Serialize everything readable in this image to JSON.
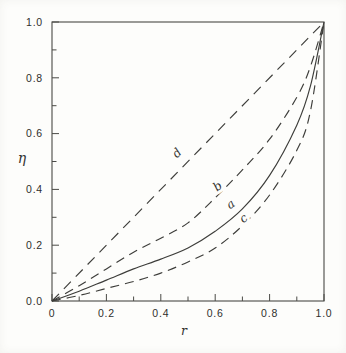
{
  "figure": {
    "background": "#fdfdfb",
    "ink_color": "#3d3d3a",
    "frame_color": "#4a4a46"
  },
  "chart_data": {
    "type": "line",
    "title": "",
    "xlabel": "r",
    "ylabel": "η",
    "xlim": [
      0,
      1.0
    ],
    "ylim": [
      0,
      1.0
    ],
    "grid": false,
    "legend_position": "none",
    "x_major_ticks": [
      0,
      0.2,
      0.4,
      0.6,
      0.8,
      1.0
    ],
    "x_tick_labels": [
      "0",
      "0.2",
      "0.4",
      "0.6",
      "0.8",
      "1.0"
    ],
    "x_minor_ticks": [
      0.1,
      0.3,
      0.5,
      0.7,
      0.9
    ],
    "y_major_ticks": [
      0,
      0.2,
      0.4,
      0.6,
      0.8,
      1.0
    ],
    "y_tick_labels": [
      "0.0",
      "0.2",
      "0.4",
      "0.6",
      "0.8",
      "1.0"
    ],
    "y_minor_ticks": [
      0.1,
      0.3,
      0.5,
      0.7,
      0.9
    ],
    "series": [
      {
        "name": "d",
        "line_style": "dashed",
        "dash": "10 7",
        "points": [
          [
            0,
            0
          ],
          [
            1,
            1
          ]
        ],
        "label": {
          "text": "d",
          "x": 0.47,
          "y": 0.52,
          "angle": -45
        }
      },
      {
        "name": "b",
        "line_style": "dashed",
        "dash": "9 6",
        "points": [
          [
            0,
            0
          ],
          [
            0.1,
            0.055
          ],
          [
            0.2,
            0.115
          ],
          [
            0.3,
            0.175
          ],
          [
            0.4,
            0.225
          ],
          [
            0.5,
            0.28
          ],
          [
            0.6,
            0.37
          ],
          [
            0.7,
            0.47
          ],
          [
            0.8,
            0.58
          ],
          [
            0.9,
            0.73
          ],
          [
            0.95,
            0.84
          ],
          [
            1,
            1
          ]
        ],
        "label": {
          "text": "b",
          "x": 0.618,
          "y": 0.4,
          "angle": -38
        }
      },
      {
        "name": "a",
        "line_style": "solid",
        "dash": "",
        "points": [
          [
            0,
            0
          ],
          [
            0.1,
            0.035
          ],
          [
            0.2,
            0.075
          ],
          [
            0.3,
            0.115
          ],
          [
            0.4,
            0.15
          ],
          [
            0.5,
            0.19
          ],
          [
            0.6,
            0.25
          ],
          [
            0.7,
            0.33
          ],
          [
            0.8,
            0.45
          ],
          [
            0.9,
            0.63
          ],
          [
            0.95,
            0.77
          ],
          [
            1,
            1
          ]
        ],
        "label": {
          "text": "a",
          "x": 0.665,
          "y": 0.335,
          "angle": -36
        }
      },
      {
        "name": "c",
        "line_style": "dashed",
        "dash": "9 6",
        "points": [
          [
            0,
            0
          ],
          [
            0.1,
            0.02
          ],
          [
            0.2,
            0.045
          ],
          [
            0.3,
            0.07
          ],
          [
            0.4,
            0.1
          ],
          [
            0.5,
            0.14
          ],
          [
            0.6,
            0.19
          ],
          [
            0.7,
            0.27
          ],
          [
            0.8,
            0.38
          ],
          [
            0.9,
            0.54
          ],
          [
            0.95,
            0.68
          ],
          [
            1,
            1
          ]
        ],
        "label": {
          "text": "c",
          "x": 0.713,
          "y": 0.285,
          "angle": -38
        }
      }
    ]
  }
}
